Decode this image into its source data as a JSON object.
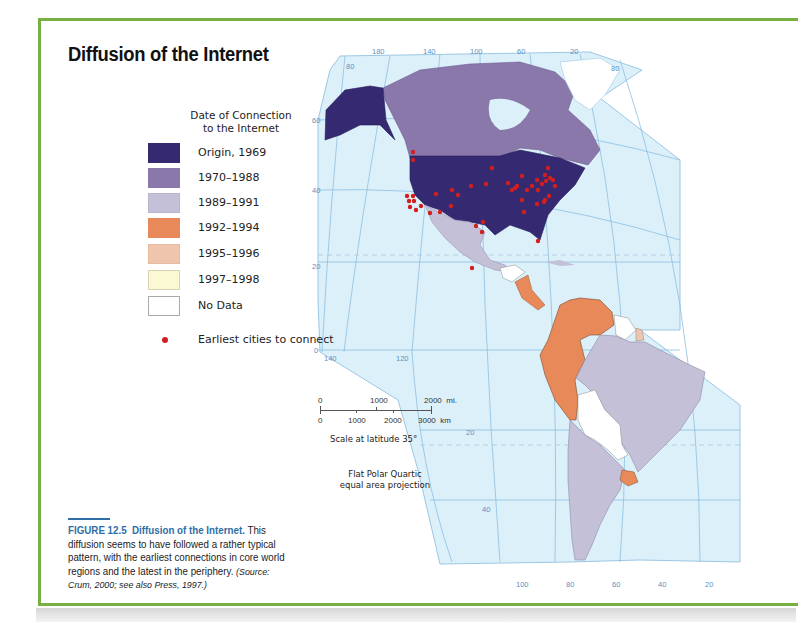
{
  "title": "Diffusion of the Internet",
  "legend": {
    "title_line1": "Date of Connection",
    "title_line2": "to the Internet",
    "items": [
      {
        "label": "Origin, 1969",
        "color": "#352a72"
      },
      {
        "label": "1970–1988",
        "color": "#8a78aa"
      },
      {
        "label": "1989–1991",
        "color": "#c4c0d8"
      },
      {
        "label": "1992–1994",
        "color": "#e8895a"
      },
      {
        "label": "1995–1996",
        "color": "#efc6ad"
      },
      {
        "label": "1997–1998",
        "color": "#fbf8d4"
      },
      {
        "label": "No Data",
        "color": "#ffffff"
      }
    ],
    "cities_label": "Earliest cities to connect",
    "cities_color": "#d21e1e"
  },
  "map": {
    "ocean_color": "#dcf0fa",
    "grid_color": "#7fb6dc",
    "longitude_top": [
      "180",
      "140",
      "100",
      "60",
      "20"
    ],
    "longitude_bottom_left": [
      "140",
      "120"
    ],
    "longitude_bottom": [
      "100",
      "80",
      "60",
      "40",
      "20"
    ],
    "latitude_left": [
      "80",
      "60",
      "40",
      "20",
      "0"
    ],
    "latitude_right": [
      "80"
    ],
    "latitude_south": [
      "20",
      "40"
    ]
  },
  "scale": {
    "mi_ticks": [
      "0",
      "1000",
      "2000"
    ],
    "mi_unit": "mi.",
    "km_ticks": [
      "0",
      "1000",
      "2000",
      "3000"
    ],
    "km_unit": "km",
    "note": "Scale at latitude 35°"
  },
  "projection": {
    "line1": "Flat Polar Quartic",
    "line2": "equal area projection"
  },
  "caption": {
    "figure_number": "FIGURE 12.5",
    "figure_title": "Diffusion of the Internet.",
    "text": " This diffusion seems to have followed a rather typical pattern, with the earliest connections in core world regions and the latest in the periphery. ",
    "source": "(Source: Crum, 2000; see also Press, 1997.)"
  }
}
